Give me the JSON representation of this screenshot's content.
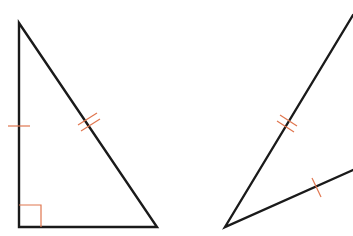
{
  "diagram": {
    "type": "geometry",
    "colors": {
      "edge": "#1a1a1a",
      "mark": "#e0764f",
      "background": "#ffffff"
    },
    "left_triangle": {
      "vertices": {
        "top": [
          19,
          23
        ],
        "right_angle": [
          19,
          227
        ],
        "bottom_right": [
          157,
          227
        ]
      },
      "right_angle_marker": {
        "at": [
          19,
          227
        ],
        "size": 22
      },
      "tick_marks": [
        {
          "side": "vertical-leg",
          "count": 1,
          "at": [
            19,
            126
          ]
        },
        {
          "side": "hypotenuse",
          "count": 2,
          "at": [
            88,
            125
          ]
        }
      ]
    },
    "right_triangle": {
      "vertices": {
        "bottom": [
          225,
          227
        ],
        "top_offscreen": [
          353,
          15
        ],
        "right_offscreen": [
          353,
          170
        ]
      },
      "tick_marks": [
        {
          "side": "long-side",
          "count": 2,
          "at": [
            289,
            124
          ]
        },
        {
          "side": "short-side",
          "count": 1,
          "at": [
            316,
            189
          ]
        }
      ]
    }
  }
}
